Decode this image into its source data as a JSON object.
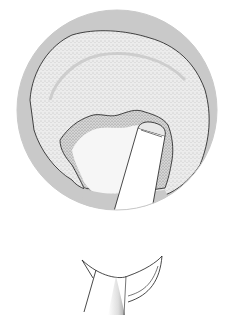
{
  "figure": {
    "colors": {
      "background": "#ffffff",
      "outer_ring": "#c8c8c8",
      "inner_field": "#e6e6e6",
      "stipple": "#7a7a7a",
      "line": "#1a1a1a",
      "shaft": "#ffffff"
    }
  },
  "mark": ""
}
